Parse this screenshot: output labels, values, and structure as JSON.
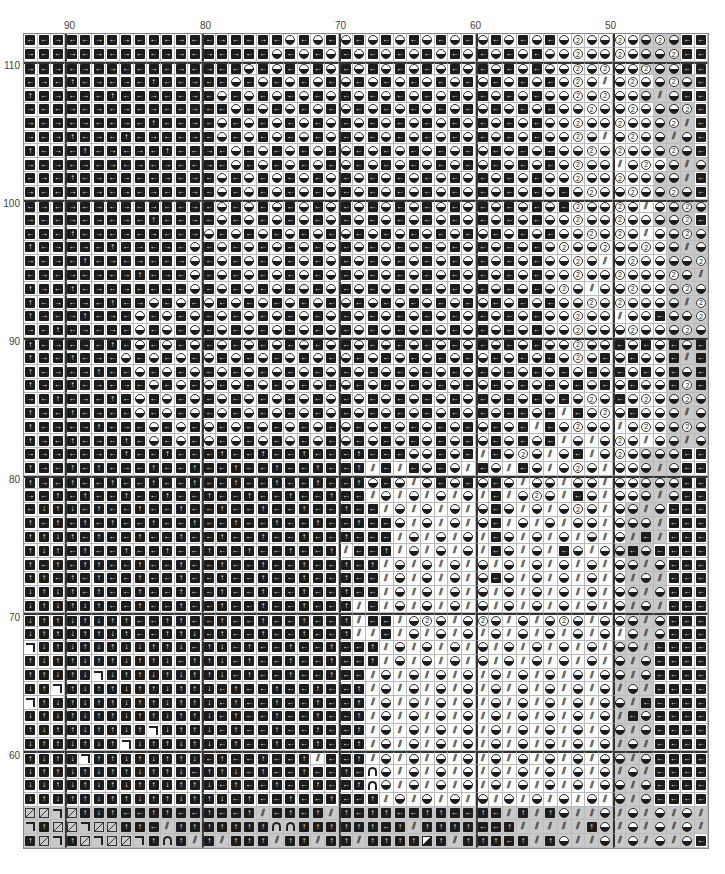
{
  "chart": {
    "column_labels": [
      {
        "text": "90",
        "x": 66
      },
      {
        "text": "80",
        "x": 202
      },
      {
        "text": "70",
        "x": 337
      },
      {
        "text": "60",
        "x": 472
      },
      {
        "text": "50",
        "x": 607
      }
    ],
    "row_labels": [
      {
        "text": "110",
        "y": 60
      },
      {
        "text": "100",
        "y": 198
      },
      {
        "text": "90",
        "y": 336
      },
      {
        "text": "80",
        "y": 474
      },
      {
        "text": "70",
        "y": 612
      },
      {
        "text": "60",
        "y": 750
      }
    ],
    "columns_from": 93,
    "columns_to": 44,
    "rows_from": 112,
    "rows_to": 54,
    "major_col_indices": [
      3,
      13,
      23,
      33,
      43
    ],
    "major_row_indices": [
      2,
      12,
      22,
      32,
      42,
      52
    ],
    "legend": {
      "L": "left-arrow-box",
      "R": "right-arrow-box",
      "U": "up-arrow-box",
      "D": "down-arrow-box",
      "H": "half-filled-circle",
      "T": "circled-2",
      "S": "diagonal-slash-marks",
      "C": "corner-mark",
      "X": "box-with-diagonal",
      "A": "arch",
      "B": "half-black-box"
    },
    "shade_note": "lowercase code = gray shaded cell",
    "rows": [
      "LLRLLRLRLLLRLLRLLRLHLHLHLHLHLHLHLHLHLHLHTHHTHhth",
      "RLLRLRLRLLRRLRLRLLHLHLHLHLHLHLHLHLHLHLHHTHHTHhht",
      "RLRLRLRLLRLRLRLLHLHLHLHLHLHLHLHLHLHLHLHHTHTHHthh",
      "LRLULRLRLULLRLLHLHLHLHLHLHLHLHLHLHLHLHLHTHSHTHhth",
      "ULRLRLULLRLLRLHLHLHLHLHLHLHLHLHLHLHLHLHHTHTHHhsh",
      "RLLRLRLRLRLLRLLHLHLHLHLHLHLHLHLHLHLHLHLHHTHHTHhht",
      "RLRLRLLRLULLRLHLHLHLHLHLHLHLHLHLHLHLHLHHTHHTHHhts",
      "RLRULRLULRLLRLHLHLHLHLHLHLHLHLHLHLHLHLHHTHSHTHhsh",
      "ULRLULRLRLULLRLHLHLHLHLHLHLHLHLHLHLHLHLHHTHTHHhth",
      "RLRLRLRLRLRLLRLHLHLHLHLHLHLHLHLHLHLHLHLHTHHSHTHhsh",
      "LRLULRLRLLRLRLHLHLHLHLHLHLHLHLHLHLHLHLHHTHHTHHhhs",
      "RLLRLRLRLRLLRLHLHLHLHLHLHLHLHLHLHLHLHLHLHTHHTHhth",
      "LRLRLRLRLRLLRLHLHLHLHLHLHLHLHLHLHLHLHLHLTHHTHSHhth",
      "RLLRLRLRLULLRLHLHLHLHLHLHLHLHLHLHLHLHLHHTHHTHHhht",
      "LRLULRLRLRLLRHLHLHLHLHLHLHLHLHLHLHLHLHLHHTHTHSHhth",
      "ULRLRLULRLRLHLHLHLHLHLHLHLHLHLHLHLHLHLHTHHTHHTHhsh",
      "RLRLULRLRLLRHLHLHLHLHLHLHLHLHLHLHLHLHLHHTHSHTHHhht",
      "LRLRLRLRULRLHLHLHLHLHLHLHLHLHLHLHLHLHLHHTHHTHHHths",
      "URLULRLRLLRLHLHLHLHLHLHLHLHLHLHLHLHLHLHTHSHHTHHhth",
      "ULRLRLULRHLHLHLHLHLHLHLHLHLHLHLHLHLHLHLHHTHTHHHhst",
      "URLRULRLHLHLHLHLHLHLHLHLHLHLHLHLHLHLHLHHTHHSHHLhht",
      "RLULRLRLHLHLHLHLHLHLHLHLHLHLHLHLHLHLHLHHTHHHTHHhth",
      "ULRLRLULHLHLHLHLHLHLHLHLHLHLHLHLHLHLHLHHTHHLHLHlhl",
      "URLULRLHLHLHLHLHLHLHLHLHLHLHLHLHLHLHLHLHTHLHLHHlsl",
      "ULRLRULLHLHLHLHLHLHLHLHLHLHLHLHLHLHLHLHLHLHLHLHlhl",
      "URLULRLRLHLHLHLHLHLHLHLHLHLHLHLHLHLHLHLHLHLHLHHltl",
      "RLULRLULHLHLHLHLHLHLHLHLHLHLHLHLHLHLHLHLHTHLHTHhth",
      "URLULRLLHLHLHLHLHLHLHLHLHLHLHLHLHLHLLHLSLHTHLHHhsh",
      "ULRLRULRLHLHLHLHLHLHLHLHLHLHLHLHLHLHLSLHTHHSHTHhth",
      "URLULRLULHLHLHLHLHLHLHLHLHLHLHLHLHLHLHLSHSHTHSHhsh",
      "RRRLLRLULLULLLULLULLULLLULLLHHLHLSLHTHSHLSHTHhhh",
      "URLULULRLULLULLULLULLULLUSLSLHLHSLHSLHSHTHSHHhsh",
      "URLULLULLULLULLULLULLULLUHLHSHLHLHLHSHHSHHSHHhhh",
      "RLULULLULLULLULLULLULLULLSHSHSHSHSLSHTHSLHSHHhsh",
      "LDUDLULLULLULLULLULLULLULLSHSHSHSHLHSHSHTHSHhsh",
      "ULULULULLULLULLULLULLULLULLHSHSHSHLSHSHSHHSHhhs",
      "UUDULULLULLULLULLULLULLULLLSHSHSHSLHSHSHSHSHsls",
      "UDULULLULLULLULLULLULLUSLLUSHSHSHSLHSHSLHSHhlh",
      "ULULUULLULLULLULLULLULLULUSHSHSHSHSHSHSHSHSHhsh",
      "UULULULLULLULLULLULLULLULLSHSHSHSHLHSHSHSHSHshs",
      "DUDULULLULLULLULLULLULLULLSHSHSHSHSHSHSHSHSHhsh",
      "DUDUDULLULLULLULLULLULLUSLSHSHSHSHSHSHSHSHSHshs",
      "DUUDUDUULLUULLULLULLULLUSLLSHTHSHTHSHSHTHSHHhsh",
      "DUUDUUDULLUUDLULLULLULLUSSLSHSHSHSHSHSHSHSHShsh",
      "CDUDUDUDDUUDLUDLULLULLULLUSHSHSHSHSHSHSHSHShhs",
      "UDUUDUUDUUDLUUDLULLULLULLUSHSHSHSHSHSHSHSHShsh",
      "UUDUDCDUUDUDUUDLULLULLULLSHSHSHSHSHSHSHSHSHhsh",
      "DUCUDUUDUUDUUDLULLULLULLUSHSHSHSHSHSHSHSHSHshs",
      "CUDUDUUDUUDUUDLULLULLULLUSHSHSHSHSHSHSHSHSHhsl",
      "DUDUDUUDUUDUUDLULLULLULLUSHSHSHSHSHSHSHSHSHslh",
      "UDUUDUUDUCDUUDLULLULLULLUSHSHSHSHSHSHSHSHSHhsh",
      "DUUDUDUCDUUDUDLULLULLULLUSHSHSHSHSHSHSHSHSHshs",
      "UDUDCUUDUDUUDLULLULLUSLLUSHSHSHSHSHSHSHSHSHhsh",
      "DUUDUDUUDUUDLUUDLULLULLULAHSHSHSHSHSHSHSHSHshs",
      "DDUDUDUDUUDUUDLULLULLULLUAHSHSHSHSHSHSHSHSHhsh",
      "DUDUUDUUDUUDUUDLULLULLULLUSHSHSHSHSHSHSHSHShsh",
      "xxcxudulluullulluslulusuluulluullulsusuhsshshshshs",
      "cuxxcxxuulsuuuuuuuaauuuuuulusuuuullusssssuhshshshs",
      "uxcuxcxxcuaususuuusuusuusuuuubusuuulusuhsshshshsh"
    ]
  }
}
